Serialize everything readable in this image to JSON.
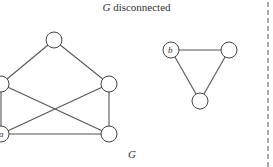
{
  "title": {
    "symbol": "G",
    "text": " disconnected"
  },
  "graph_label": "G",
  "components": [
    {
      "name": "pentagon-component",
      "nodes": [
        {
          "id": "top",
          "label": "",
          "x": 54,
          "y": 40
        },
        {
          "id": "left-mid",
          "label": "",
          "x": 1,
          "y": 84
        },
        {
          "id": "right-mid",
          "label": "",
          "x": 109,
          "y": 84
        },
        {
          "id": "a",
          "label": "a",
          "x": 1,
          "y": 134
        },
        {
          "id": "bottom-right",
          "label": "",
          "x": 109,
          "y": 134
        }
      ],
      "edges": [
        [
          "top",
          "left-mid"
        ],
        [
          "top",
          "right-mid"
        ],
        [
          "left-mid",
          "a"
        ],
        [
          "left-mid",
          "bottom-right"
        ],
        [
          "right-mid",
          "a"
        ],
        [
          "right-mid",
          "bottom-right"
        ],
        [
          "a",
          "bottom-right"
        ]
      ]
    },
    {
      "name": "triangle-component",
      "nodes": [
        {
          "id": "b",
          "label": "b",
          "x": 171,
          "y": 50
        },
        {
          "id": "tri-right",
          "label": "",
          "x": 229,
          "y": 50
        },
        {
          "id": "tri-bottom",
          "label": "",
          "x": 200,
          "y": 101
        }
      ],
      "edges": [
        [
          "b",
          "tri-right"
        ],
        [
          "b",
          "tri-bottom"
        ],
        [
          "tri-right",
          "tri-bottom"
        ]
      ]
    }
  ],
  "colors": {
    "edge": "#555555",
    "node_stroke": "#444444",
    "node_fill": "#ffffff",
    "text": "#333333"
  }
}
